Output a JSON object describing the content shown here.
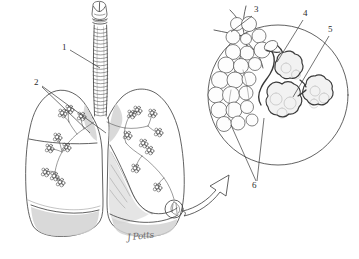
{
  "figure": {
    "kind": "anatomical-line-drawing",
    "background_color": "#ffffff",
    "ink_color": "#3a3a3a",
    "shade_color": "#cfcfcf"
  },
  "labels": [
    {
      "id": "1",
      "text": "1",
      "x": 62,
      "y": 47,
      "target": "trachea"
    },
    {
      "id": "2",
      "text": "2",
      "x": 34,
      "y": 81,
      "target": "bronchi"
    },
    {
      "id": "3",
      "text": "3",
      "x": 254,
      "y": 8,
      "target": "alveolar-sac-cluster"
    },
    {
      "id": "4",
      "text": "4",
      "x": 303,
      "y": 12,
      "target": "terminal-bronchiole"
    },
    {
      "id": "5",
      "text": "5",
      "x": 328,
      "y": 28,
      "target": "alveolus-cross-section"
    },
    {
      "id": "6",
      "text": "6",
      "x": 252,
      "y": 183,
      "target": "alveoli"
    }
  ],
  "parts": {
    "larynx": "larynx",
    "trachea": "trachea",
    "left_lung": "left lung",
    "right_lung": "right lung",
    "bronchial_tree": "bronchial tree",
    "magnifier_circle": "magnified alveoli inset",
    "magnifier_arrow": "magnification arrow",
    "detail_circle": "detail callout circle on lung"
  },
  "signature": {
    "text": "J Potts"
  }
}
